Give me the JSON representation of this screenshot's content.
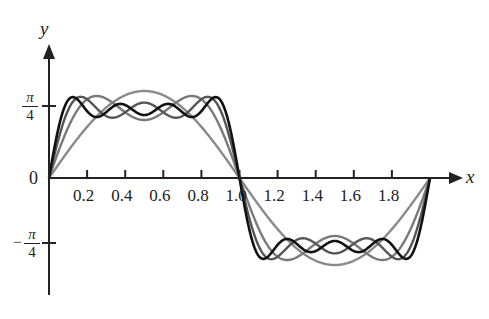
{
  "chart_data": {
    "type": "line",
    "title": "",
    "xlabel": "x",
    "ylabel": "y",
    "xlim": [
      0,
      2
    ],
    "ylim": [
      -1.2,
      1.55
    ],
    "x_ticks": [
      0.2,
      0.4,
      0.6,
      0.8,
      1.0,
      1.2,
      1.4,
      1.6,
      1.8
    ],
    "x_tick_labels": [
      "0.2",
      "0.4",
      "0.6",
      "0.8",
      "1.0",
      "1.2",
      "1.4",
      "1.6",
      "1.8"
    ],
    "y_ticks": [
      0.7854,
      0,
      -0.7854
    ],
    "y_tick_labels": [
      "π/4",
      "0",
      "−π/4"
    ],
    "grid": false,
    "legend": null,
    "series": [
      {
        "name": "N=1",
        "terms": [
          1
        ],
        "color": "#8a8a8a",
        "peak": 1.0
      },
      {
        "name": "N=3",
        "terms": [
          1,
          3
        ],
        "color": "#7a7a7a",
        "peak": 0.94
      },
      {
        "name": "N=5",
        "terms": [
          1,
          3,
          5
        ],
        "color": "#555555",
        "peak": 0.93
      },
      {
        "name": "N=7",
        "terms": [
          1,
          3,
          5,
          7
        ],
        "color": "#111111",
        "peak": 0.92
      }
    ]
  },
  "labels": {
    "x_axis": "x",
    "y_axis": "y",
    "zero": "0",
    "pi": "π",
    "four": "4",
    "minus": "−",
    "ticks": [
      "0.2",
      "0.4",
      "0.6",
      "0.8",
      "1.0",
      "1.2",
      "1.4",
      "1.6",
      "1.8"
    ]
  }
}
